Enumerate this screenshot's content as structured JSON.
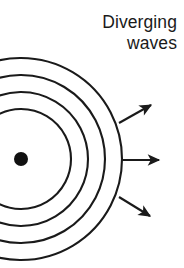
{
  "figure": {
    "title_lines": [
      "Diverging",
      "waves"
    ],
    "background_color": "#ffffff",
    "ink_color": "#1a1a1a",
    "width": 184,
    "height": 268
  },
  "source": {
    "label": "point-source",
    "center_x": 21,
    "center_y": 159,
    "radius": 7,
    "fill_color": "#111111"
  },
  "wavefronts": {
    "label": "concentric-wavefront-arcs",
    "count": 4,
    "center_x": 21,
    "center_y": 159,
    "stroke_color": "#1a1a1a",
    "stroke_width": 2.1,
    "start_angle_deg": -118,
    "end_angle_deg": 118,
    "radii": [
      50,
      67,
      84,
      101
    ]
  },
  "rays": {
    "label": "propagation-direction-arrows",
    "count": 3,
    "stroke_color": "#1a1a1a",
    "stroke_width": 2.1,
    "items": [
      {
        "name": "upper-ray",
        "angle_deg": -28,
        "x1": 119,
        "y1": 123,
        "x2": 151,
        "y2": 105
      },
      {
        "name": "middle-ray",
        "angle_deg": 0,
        "x1": 122,
        "y1": 160,
        "x2": 159,
        "y2": 160
      },
      {
        "name": "lower-ray",
        "angle_deg": 30,
        "x1": 119,
        "y1": 197,
        "x2": 150,
        "y2": 216
      }
    ]
  },
  "chart_data": {
    "type": "diagram",
    "title": "Diverging waves",
    "elements": [
      {
        "kind": "point-source",
        "x": 21,
        "y": 159,
        "radius": 7
      },
      {
        "kind": "arc",
        "index": 1,
        "radius": 50,
        "center": [
          21,
          159
        ],
        "span_deg": 236
      },
      {
        "kind": "arc",
        "index": 2,
        "radius": 67,
        "center": [
          21,
          159
        ],
        "span_deg": 236
      },
      {
        "kind": "arc",
        "index": 3,
        "radius": 84,
        "center": [
          21,
          159
        ],
        "span_deg": 236
      },
      {
        "kind": "arc",
        "index": 4,
        "radius": 101,
        "center": [
          21,
          159
        ],
        "span_deg": 236
      },
      {
        "kind": "arrow",
        "index": 1,
        "angle_deg": -28
      },
      {
        "kind": "arrow",
        "index": 2,
        "angle_deg": 0
      },
      {
        "kind": "arrow",
        "index": 3,
        "angle_deg": 30
      }
    ]
  }
}
